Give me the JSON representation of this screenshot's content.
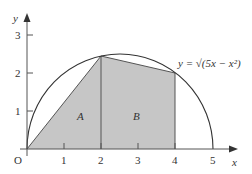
{
  "diagram": {
    "axes": {
      "x_label": "x",
      "y_label": "y",
      "origin_label": "O",
      "x_ticks": [
        "1",
        "2",
        "3",
        "4",
        "5"
      ],
      "y_ticks": [
        "1",
        "2",
        "3"
      ]
    },
    "curve": {
      "equation_label": "y = √(5x − x²)",
      "type": "semicircle",
      "center": [
        2.5,
        0
      ],
      "radius": 2.5
    },
    "regions": [
      {
        "label": "A",
        "vertices": [
          [
            0,
            0
          ],
          [
            2,
            2.449
          ],
          [
            2,
            0
          ]
        ]
      },
      {
        "label": "B",
        "vertices": [
          [
            2,
            0
          ],
          [
            2,
            2.449
          ],
          [
            4,
            2
          ],
          [
            4,
            0
          ]
        ]
      }
    ],
    "colors": {
      "fill": "#c6c6c6",
      "stroke": "#333333"
    }
  }
}
